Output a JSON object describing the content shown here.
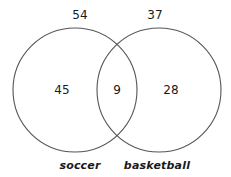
{
  "diagram": {
    "type": "venn",
    "sets": [
      {
        "name": "soccer",
        "total": "54",
        "only": "45"
      },
      {
        "name": "basketball",
        "total": "37",
        "only": "28"
      }
    ],
    "intersection": "9",
    "colors": {
      "stroke": "#555555",
      "text": "#1a1a1a",
      "background": "#ffffff"
    }
  }
}
